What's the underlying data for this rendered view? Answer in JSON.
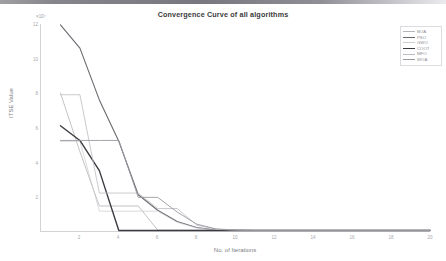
{
  "window": {
    "topbar_present": true
  },
  "chart_data": {
    "type": "line",
    "title": "Convergence Curve of all algorithms",
    "xlabel": "No. of Iterations",
    "ylabel": "ITSE Value",
    "y_exponent": "×10⁴",
    "xlim": [
      0,
      20
    ],
    "ylim": [
      0,
      12
    ],
    "grid": false,
    "legend_position": "top-right",
    "xticks": [
      "2",
      "4",
      "6",
      "8",
      "10",
      "12",
      "14",
      "16",
      "18",
      "20"
    ],
    "yticks": [
      "2",
      "4",
      "6",
      "8",
      "10",
      "12"
    ],
    "x": [
      1,
      2,
      3,
      4,
      5,
      6,
      7,
      8,
      9,
      10,
      11,
      12,
      13,
      14,
      15,
      16,
      17,
      18,
      19,
      20
    ],
    "series": [
      {
        "name": "BOA",
        "color": "#b4b4b9",
        "width": 0.8,
        "values": [
          8.0,
          4.6,
          1.45,
          1.45,
          1.45,
          0.05,
          0.05,
          0.05,
          0.05,
          0.05,
          0.05,
          0.05,
          0.05,
          0.05,
          0.05,
          0.05,
          0.05,
          0.05,
          0.05,
          0.05
        ]
      },
      {
        "name": "PSO",
        "color": "#6a6a70",
        "width": 1.1,
        "values": [
          11.95,
          10.6,
          7.6,
          5.2,
          2.1,
          1.2,
          0.55,
          0.2,
          0.06,
          0.04,
          0.03,
          0.03,
          0.03,
          0.03,
          0.03,
          0.03,
          0.03,
          0.03,
          0.03,
          0.03
        ]
      },
      {
        "name": "GWO",
        "color": "#cccccf",
        "width": 0.7,
        "values": [
          5.2,
          5.2,
          1.15,
          1.15,
          1.15,
          1.15,
          0.5,
          0.18,
          0.06,
          0.04,
          0.03,
          0.03,
          0.03,
          0.03,
          0.03,
          0.03,
          0.03,
          0.03,
          0.03,
          0.03
        ]
      },
      {
        "name": "COOT",
        "color": "#3c3c42",
        "width": 1.4,
        "values": [
          6.1,
          5.25,
          3.5,
          0.03,
          0.03,
          0.03,
          0.03,
          0.03,
          0.03,
          0.03,
          0.03,
          0.03,
          0.03,
          0.03,
          0.03,
          0.03,
          0.03,
          0.03,
          0.03,
          0.03
        ]
      },
      {
        "name": "MFO",
        "color": "#bcbcc1",
        "width": 0.8,
        "values": [
          7.9,
          7.9,
          2.2,
          2.2,
          2.2,
          1.3,
          1.3,
          0.35,
          0.1,
          0.05,
          0.04,
          0.04,
          0.04,
          0.04,
          0.04,
          0.04,
          0.04,
          0.04,
          0.04,
          0.04
        ]
      },
      {
        "name": "WOA",
        "color": "#9a9aa0",
        "width": 0.9,
        "values": [
          5.25,
          5.25,
          5.25,
          5.25,
          1.95,
          1.95,
          1.1,
          0.4,
          0.12,
          0.06,
          0.04,
          0.04,
          0.04,
          0.04,
          0.04,
          0.04,
          0.04,
          0.04,
          0.04,
          0.04
        ]
      }
    ]
  }
}
